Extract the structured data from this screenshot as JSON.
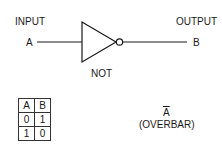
{
  "diagram": {
    "input": {
      "caption": "INPUT",
      "signal": "A"
    },
    "output": {
      "caption": "OUTPUT",
      "signal": "B"
    },
    "gate_label": "NOT",
    "colors": {
      "line": "#1a1a1a",
      "background": "#ffffff"
    }
  },
  "truth_table": {
    "headers": [
      "A",
      "B"
    ],
    "rows": [
      [
        "0",
        "1"
      ],
      [
        "1",
        "0"
      ]
    ]
  },
  "notation": {
    "expression": "A",
    "caption": "(OVERBAR)"
  }
}
